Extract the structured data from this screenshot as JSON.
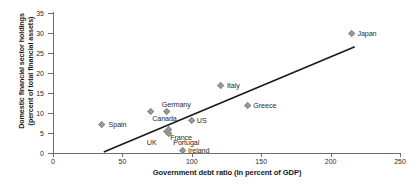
{
  "chart_data": {
    "type": "scatter",
    "title": "",
    "xlabel": "Government debt ratio (In percent of GDP)",
    "ylabel": "Domestic financial sector holdings\n(percent of total financial assets)",
    "xlim": [
      0,
      250
    ],
    "ylim": [
      0,
      35
    ],
    "xticks": [
      "0",
      "50",
      "100",
      "150",
      "200",
      "250"
    ],
    "xtick_values": [
      0,
      50,
      100,
      150,
      200,
      250
    ],
    "yticks": [
      "0",
      "5",
      "10",
      "15",
      "20",
      "25",
      "30",
      "35"
    ],
    "ytick_values": [
      0,
      5,
      10,
      15,
      20,
      25,
      30,
      35
    ],
    "grid": false,
    "legend": "none",
    "marker_color": "#9b9b9b",
    "line_color": "#1a1a1a",
    "points": [
      {
        "label": "Spain",
        "x": 35,
        "y": 7.2,
        "label_dx": 7,
        "label_dy": -3
      },
      {
        "label": "Canada",
        "x": 70,
        "y": 10.3,
        "label_dx": 2,
        "label_dy": 3
      },
      {
        "label": "Germany",
        "x": 82,
        "y": 10.5,
        "label_dx": -5,
        "label_dy": -10
      },
      {
        "label": "UK",
        "x": 82,
        "y": 5.5,
        "label_dx": -20,
        "label_dy": 8
      },
      {
        "label": "France",
        "x": 83,
        "y": 5.0,
        "label_dx": 2,
        "label_dy": 1
      },
      {
        "label": "Portugal",
        "x": 83,
        "y": 5.8,
        "label_dx": 5,
        "label_dy": 9
      },
      {
        "label": "US",
        "x": 100,
        "y": 8.2,
        "label_dx": 5,
        "label_dy": -3
      },
      {
        "label": "Ireland",
        "x": 93,
        "y": 0.7,
        "label_dx": 6,
        "label_dy": -3
      },
      {
        "label": "Italy",
        "x": 121,
        "y": 17.0,
        "label_dx": 6,
        "label_dy": -3
      },
      {
        "label": "Greece",
        "x": 140,
        "y": 12.0,
        "label_dx": 6,
        "label_dy": -3
      },
      {
        "label": "Japan",
        "x": 215,
        "y": 30.0,
        "label_dx": 6,
        "label_dy": -3
      }
    ],
    "trend_line": {
      "x1": 37,
      "y1": 0.3,
      "x2": 217,
      "y2": 26.5
    }
  }
}
